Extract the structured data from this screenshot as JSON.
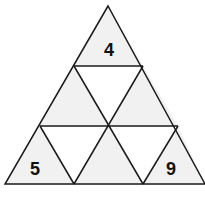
{
  "diagram": {
    "colors": {
      "shaded": "#f1f1f1",
      "unshaded": "#ffffff",
      "stroke": "#1a1a1a"
    },
    "labels": {
      "top": "4",
      "bottom_left": "5",
      "bottom_right": "9"
    }
  }
}
